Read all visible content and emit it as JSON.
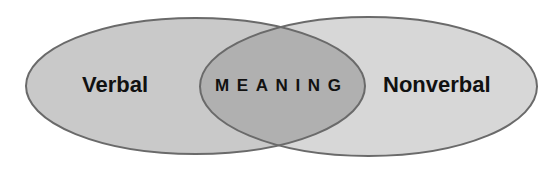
{
  "diagram": {
    "type": "venn",
    "sets": [
      {
        "id": "verbal",
        "label": "Verbal",
        "fill": "#c9c9c9",
        "stroke": "#6a6a6a",
        "cx": 195.5,
        "cy": 86,
        "rx": 169.5,
        "ry": 68
      },
      {
        "id": "nonverbal",
        "label": "Nonverbal",
        "fill": "#d7d7d7",
        "stroke": "#6a6a6a",
        "cx": 368.5,
        "cy": 86.5,
        "rx": 168.5,
        "ry": 69.5
      }
    ],
    "intersection": {
      "label": "MEANING",
      "fill": "#b0b0b0"
    },
    "labels": {
      "left": "Verbal",
      "center": "MEANING",
      "right": "Nonverbal"
    },
    "colors": {
      "background": "#ffffff",
      "text": "#111111",
      "outline": "#6a6a6a"
    }
  }
}
